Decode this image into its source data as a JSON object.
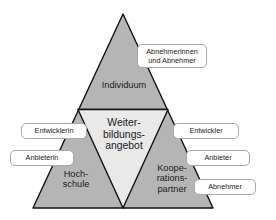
{
  "diagram": {
    "type": "triangle-model",
    "colors": {
      "outer_fill": "#b5b5b5",
      "inner_fill": "#e9e9e9",
      "outline": "#111111",
      "callout_fill": "#ffffff",
      "callout_border": "#a8a8a8",
      "text": "#1b1b1b",
      "background": "#ffffff"
    },
    "segments": [
      {
        "id": "individuum",
        "label": "Individuum",
        "position": "top"
      },
      {
        "id": "weiterbildungsangebot",
        "label": "Weiter-\nbildungs-\nangebot",
        "position": "center"
      },
      {
        "id": "hochschule",
        "label": "Hoch-\nschule",
        "position": "bottom-left"
      },
      {
        "id": "kooperationspartner",
        "label": "Koope-\nrations-\npartner",
        "position": "bottom-right"
      }
    ],
    "callouts": [
      {
        "id": "abnehmerinnen-und-abnehmer",
        "label": "Abnehmerinnen\nund Abnehmer",
        "anchor": "individuum"
      },
      {
        "id": "entwicklerin",
        "label": "Entwicklerin",
        "anchor": "hochschule"
      },
      {
        "id": "entwickler",
        "label": "Entwickler",
        "anchor": "kooperationspartner"
      },
      {
        "id": "anbieterin",
        "label": "Anbieterin",
        "anchor": "hochschule"
      },
      {
        "id": "anbieter",
        "label": "Anbieter",
        "anchor": "kooperationspartner"
      },
      {
        "id": "abnehmer",
        "label": "Abnehmer",
        "anchor": "kooperationspartner"
      }
    ]
  }
}
